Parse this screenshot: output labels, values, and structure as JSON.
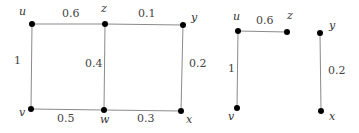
{
  "graphs": [
    {
      "name": "full-graph",
      "nodes": [
        {
          "id": "u",
          "label": "u",
          "x": 32,
          "y": 24,
          "lx": 19,
          "ly": 15
        },
        {
          "id": "z",
          "label": "z",
          "x": 105,
          "y": 24,
          "lx": 101,
          "ly": 12
        },
        {
          "id": "y",
          "label": "y",
          "x": 183,
          "y": 25,
          "lx": 191,
          "ly": 21
        },
        {
          "id": "v",
          "label": "v",
          "x": 31,
          "y": 109,
          "lx": 19,
          "ly": 116
        },
        {
          "id": "w",
          "label": "w",
          "x": 104,
          "y": 110,
          "lx": 100,
          "ly": 123
        },
        {
          "id": "x",
          "label": "x",
          "x": 181,
          "y": 111,
          "lx": 186,
          "ly": 123
        }
      ],
      "edges": [
        {
          "from": "u",
          "to": "z",
          "weight": "0.6",
          "lx": 62,
          "ly": 17
        },
        {
          "from": "z",
          "to": "y",
          "weight": "0.1",
          "lx": 138,
          "ly": 17
        },
        {
          "from": "u",
          "to": "v",
          "weight": "1",
          "lx": 14,
          "ly": 64
        },
        {
          "from": "z",
          "to": "w",
          "weight": "0.4",
          "lx": 85,
          "ly": 67
        },
        {
          "from": "y",
          "to": "x",
          "weight": "0.2",
          "lx": 189,
          "ly": 67
        },
        {
          "from": "v",
          "to": "w",
          "weight": "0.5",
          "lx": 57,
          "ly": 122
        },
        {
          "from": "w",
          "to": "x",
          "weight": "0.3",
          "lx": 137,
          "ly": 122
        }
      ]
    },
    {
      "name": "subgraph-1",
      "nodes": [
        {
          "id": "u",
          "label": "u",
          "x": 238,
          "y": 31,
          "lx": 233,
          "ly": 20
        },
        {
          "id": "z",
          "label": "z",
          "x": 287,
          "y": 32,
          "lx": 287,
          "ly": 19
        },
        {
          "id": "v",
          "label": "v",
          "x": 237,
          "y": 108,
          "lx": 228,
          "ly": 120
        }
      ],
      "edges": [
        {
          "from": "u",
          "to": "z",
          "weight": "0.6",
          "lx": 256,
          "ly": 24
        },
        {
          "from": "u",
          "to": "v",
          "weight": "1",
          "lx": 228,
          "ly": 72
        }
      ]
    },
    {
      "name": "subgraph-2",
      "nodes": [
        {
          "id": "y",
          "label": "y",
          "x": 320,
          "y": 33,
          "lx": 329,
          "ly": 29
        },
        {
          "id": "x",
          "label": "x",
          "x": 321,
          "y": 111,
          "lx": 329,
          "ly": 120
        }
      ],
      "edges": [
        {
          "from": "y",
          "to": "x",
          "weight": "0.2",
          "lx": 328,
          "ly": 74
        }
      ]
    }
  ]
}
